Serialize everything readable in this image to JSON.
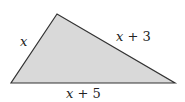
{
  "diagram": {
    "type": "triangle",
    "fill_color": "#d9d9d9",
    "stroke_color": "#333333",
    "vertices": [
      [
        57,
        14
      ],
      [
        11,
        83
      ],
      [
        175,
        83
      ]
    ],
    "sides": {
      "left": {
        "var": "x",
        "expr": ""
      },
      "right": {
        "var": "x",
        "expr": " + 3"
      },
      "bottom": {
        "var": "x",
        "expr": " + 5"
      }
    }
  }
}
